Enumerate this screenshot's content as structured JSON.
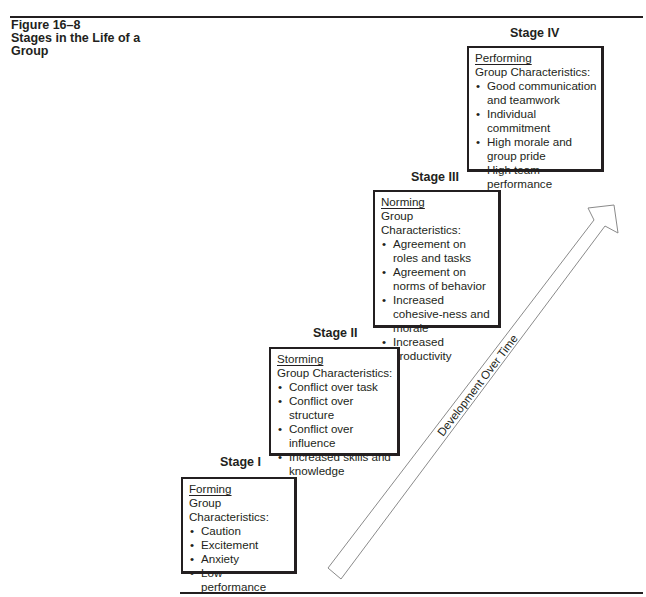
{
  "figure": {
    "number": "Figure 16–8",
    "title": "Stages in the Life of a Group"
  },
  "arrow": {
    "label": "Development Over Time",
    "stroke_color": "#8a8a8a"
  },
  "stages": [
    {
      "label": "Stage I",
      "name": "Forming",
      "subheading": "Group Characteristics:",
      "items": [
        "Caution",
        "Excitement",
        "Anxiety",
        "Low performance"
      ]
    },
    {
      "label": "Stage II",
      "name": "Storming",
      "subheading": "Group Characteristics:",
      "items": [
        "Conflict over task",
        "Conflict over structure",
        "Conflict over influence",
        "Increased skills and knowledge"
      ]
    },
    {
      "label": "Stage III",
      "name": "Norming",
      "subheading": "Group Characteristics:",
      "items": [
        "Agreement on roles and tasks",
        "Agreement on norms of behavior",
        "Increased cohesive-ness and morale",
        "Increased productivity"
      ]
    },
    {
      "label": "Stage IV",
      "name": "Performing",
      "subheading": "Group Characteristics:",
      "items": [
        "Good communication and teamwork",
        "Individual commitment",
        "High morale and group pride",
        "High team performance"
      ]
    }
  ],
  "bullet_glyph": "•",
  "colors": {
    "text": "#231f20",
    "rule": "#231f20",
    "box_border": "#231f20",
    "arrow_outline": "#8a8a8a"
  }
}
